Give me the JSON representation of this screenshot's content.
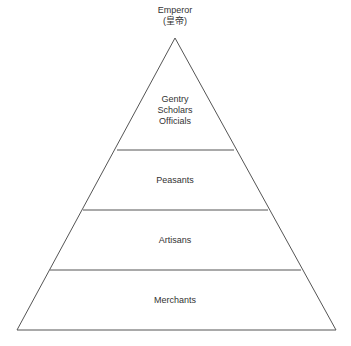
{
  "diagram": {
    "type": "pyramid",
    "apex_label": "Emperor",
    "apex_sublabel": "(皇帝)",
    "tiers": [
      {
        "lines": [
          "Gentry",
          "Scholars",
          "Officials"
        ]
      },
      {
        "lines": [
          "Peasants"
        ]
      },
      {
        "lines": [
          "Artisans"
        ]
      },
      {
        "lines": [
          "Merchants"
        ]
      }
    ],
    "colors": {
      "line": "#555555",
      "text": "#333333",
      "background": "#ffffff"
    }
  }
}
